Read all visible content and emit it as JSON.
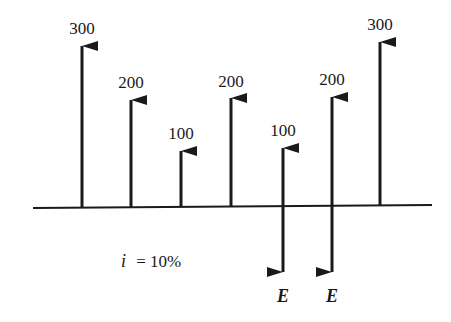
{
  "diagram": {
    "type": "cash-flow-diagram",
    "interest_label": "i = 10%",
    "interest_var": "i",
    "interest_eq": "= 10%",
    "ink_color": "#1a1a1a",
    "axis": {
      "x1": 33,
      "y1": 208,
      "x2": 432,
      "y2": 205
    },
    "flows": [
      {
        "period": 0,
        "label": "300",
        "direction": "up",
        "x": 82,
        "top": 46,
        "label_y": 34
      },
      {
        "period": 1,
        "label": "200",
        "direction": "up",
        "x": 131,
        "top": 100,
        "label_y": 88
      },
      {
        "period": 2,
        "label": "100",
        "direction": "up",
        "x": 181,
        "top": 151,
        "label_y": 139
      },
      {
        "period": 3,
        "label": "200",
        "direction": "up",
        "x": 231,
        "top": 98,
        "label_y": 87
      },
      {
        "period": 4,
        "label": "100",
        "direction": "up",
        "x": 283,
        "top": 148,
        "label_y": 136
      },
      {
        "period": 5,
        "label": "200",
        "direction": "up",
        "x": 332,
        "top": 97,
        "label_y": 85
      },
      {
        "period": 6,
        "label": "300",
        "direction": "up",
        "x": 380,
        "top": 42,
        "label_y": 30
      }
    ],
    "expenses": [
      {
        "period": 4,
        "label": "E",
        "direction": "down",
        "x": 283,
        "bottom": 272,
        "label_y": 302
      },
      {
        "period": 5,
        "label": "E",
        "direction": "down",
        "x": 332,
        "bottom": 272,
        "label_y": 302
      }
    ]
  },
  "chart_data": {
    "type": "cash-flow",
    "title": "",
    "annotation": "i = 10%",
    "categories": [
      "0",
      "1",
      "2",
      "3",
      "4",
      "5",
      "6"
    ],
    "series": [
      {
        "name": "receipts",
        "values": [
          300,
          200,
          100,
          200,
          100,
          200,
          300
        ]
      },
      {
        "name": "expenses",
        "values": [
          null,
          null,
          null,
          null,
          "E",
          "E",
          null
        ]
      }
    ]
  }
}
